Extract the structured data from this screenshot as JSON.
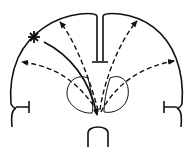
{
  "diagram": {
    "type": "schematic",
    "colors": {
      "stroke": "#111111",
      "background": "#ffffff"
    },
    "elements": {
      "focus_marker": "asterisk-star",
      "solid_arrow": "star-to-center",
      "dashed_arrows": 4,
      "deep_nuclei": 2
    }
  }
}
